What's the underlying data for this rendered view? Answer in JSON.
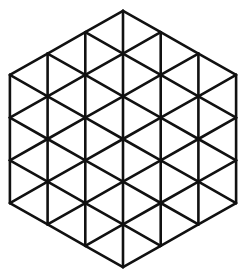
{
  "diagram": {
    "shape": "hexagon",
    "hex_side_triangles": 3,
    "center": [
      123,
      139
    ],
    "triangle_side_px": 42.7,
    "column_width_px": 37.7,
    "stroke_color": "#111111",
    "stroke_width": 2.6,
    "background": "#ffffff",
    "vertices": {
      "top": [
        123,
        14
      ],
      "top_left": [
        10,
        75
      ],
      "bottom_left": [
        10,
        203
      ],
      "bottom": [
        123,
        264
      ],
      "bottom_right": [
        236,
        203
      ],
      "top_right": [
        236,
        75
      ]
    }
  }
}
